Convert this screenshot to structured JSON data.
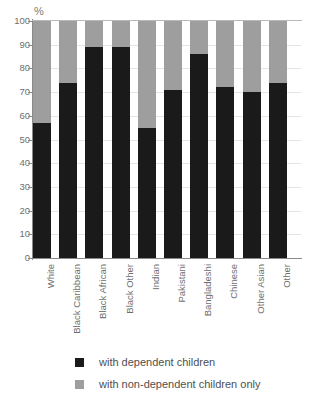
{
  "chart_data": {
    "type": "bar",
    "subtype": "stacked-100-percent",
    "title": "",
    "xlabel": "",
    "ylabel": "%",
    "ylim": [
      0,
      100
    ],
    "ytick_step": 10,
    "yticks": [
      100,
      90,
      80,
      70,
      60,
      50,
      40,
      30,
      20,
      10,
      0
    ],
    "ytick_labels": [
      "100",
      "90",
      "80",
      "70",
      "60",
      "50",
      "40",
      "30",
      "20",
      "10",
      "0"
    ],
    "grid": true,
    "legend_position": "bottom",
    "categories": [
      "White",
      "Black Caribbean",
      "Black African",
      "Black Other",
      "Indian",
      "Pakistani",
      "Bangladeshi",
      "Chinese",
      "Other Asian",
      "Other"
    ],
    "series": [
      {
        "name": "with dependent children",
        "color": "#1a1a1a",
        "values": [
          57,
          74,
          89,
          89,
          55,
          71,
          86,
          72,
          70,
          74
        ]
      },
      {
        "name": "with non-dependent children only",
        "color": "#9e9e9e",
        "values": [
          43,
          26,
          11,
          11,
          45,
          29,
          14,
          28,
          30,
          26
        ]
      }
    ]
  },
  "legend": {
    "items": [
      {
        "label": "with dependent children",
        "color": "#1a1a1a"
      },
      {
        "label": "with non-dependent children only",
        "color": "#9e9e9e"
      }
    ]
  },
  "axes": {
    "y_unit": "%"
  }
}
